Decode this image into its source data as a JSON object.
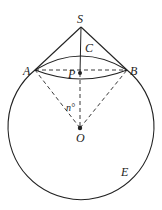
{
  "diagram": {
    "labels": {
      "S": "S",
      "C": "C",
      "A": "A",
      "B": "B",
      "P": "P",
      "O": "O",
      "E": "E",
      "angle": "n°"
    },
    "points": {
      "S": [
        81,
        27
      ],
      "A": [
        35,
        70
      ],
      "B": [
        127,
        70
      ],
      "P": [
        80,
        73
      ],
      "O": [
        80,
        128
      ]
    },
    "sphere": {
      "center": [
        80,
        128
      ],
      "radius": 73
    },
    "colors": {
      "line": "#222222",
      "background": "#ffffff"
    }
  }
}
